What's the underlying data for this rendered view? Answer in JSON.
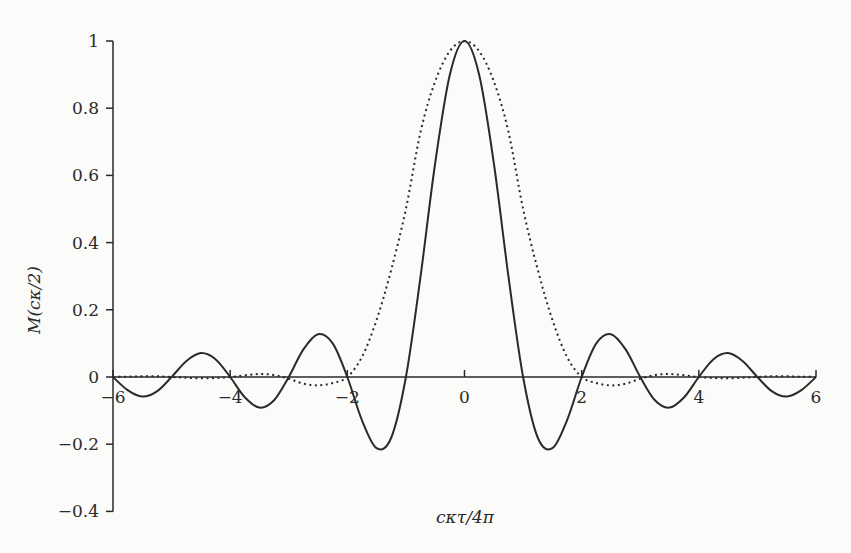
{
  "chart_data": {
    "type": "line",
    "title": "",
    "xlabel": "cκτ/4π",
    "ylabel": "M(cκ/2)",
    "xlim": [
      -6,
      6
    ],
    "ylim": [
      -0.4,
      1
    ],
    "x_ticks": [
      -6,
      -4,
      -2,
      0,
      2,
      4,
      6
    ],
    "x_tick_labels": [
      "−6",
      "−4",
      "−2",
      "0",
      "2",
      "4",
      "6"
    ],
    "y_ticks": [
      -0.4,
      -0.2,
      0,
      0.2,
      0.4,
      0.6,
      0.8,
      1
    ],
    "y_tick_labels": [
      "−0.4",
      "−0.2",
      "0",
      "0.2",
      "0.4",
      "0.6",
      "0.8",
      "1"
    ],
    "grid": false,
    "legend": null,
    "x_half": [
      0,
      0.25,
      0.5,
      0.75,
      1,
      1.25,
      1.5,
      1.75,
      2,
      2.25,
      2.5,
      2.75,
      3,
      3.25,
      3.5,
      3.75,
      4,
      4.25,
      4.5,
      4.75,
      5,
      5.25,
      5.5,
      5.75,
      6
    ],
    "symmetric": true,
    "series": [
      {
        "name": "solid",
        "style": "solid",
        "values": [
          1,
          0.9,
          0.637,
          0.3,
          0,
          -0.18,
          -0.212,
          -0.129,
          0,
          0.1,
          0.127,
          0.082,
          0,
          -0.069,
          -0.091,
          -0.06,
          0,
          0.053,
          0.071,
          0.047,
          0,
          -0.043,
          -0.058,
          -0.039,
          0
        ]
      },
      {
        "name": "dotted",
        "style": "dotted",
        "values": [
          1,
          0.97,
          0.88,
          0.73,
          0.5,
          0.32,
          0.17,
          0.06,
          0,
          -0.018,
          -0.025,
          -0.02,
          -0.005,
          0.006,
          0.009,
          0.005,
          0,
          -0.003,
          -0.004,
          -0.002,
          0,
          0.002,
          0.002,
          0.001,
          0
        ]
      }
    ]
  },
  "axes": {
    "x_label": "cκτ/4π",
    "y_label": "M(cκ/2)"
  }
}
